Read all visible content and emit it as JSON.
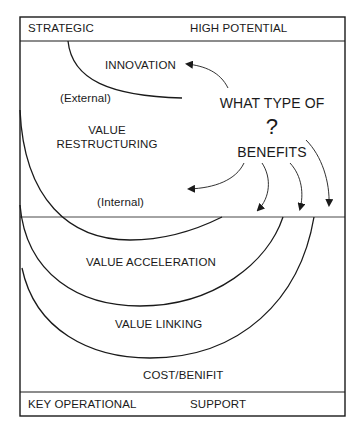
{
  "header": {
    "left_label": "STRATEGIC",
    "right_label": "HIGH POTENTIAL"
  },
  "footer": {
    "left_label": "KEY OPERATIONAL",
    "right_label": "SUPPORT"
  },
  "regions": {
    "innovation": "INNOVATION",
    "external": "(External)",
    "value_restructuring_line1": "VALUE",
    "value_restructuring_line2": "RESTRUCTURING",
    "internal": "(Internal)",
    "value_acceleration": "VALUE ACCELERATION",
    "value_linking": "VALUE LINKING",
    "cost_benefit": "COST/BENIFIT"
  },
  "question": {
    "line1": "WHAT TYPE OF",
    "mark": "?",
    "line2": "BENEFITS"
  },
  "colors": {
    "line": "#1a1a1a",
    "background": "#ffffff"
  }
}
